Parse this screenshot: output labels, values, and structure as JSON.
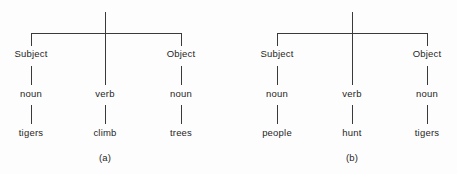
{
  "figure": {
    "background_color": "#fdfdfd",
    "line_color": "#3a3a3a",
    "text_color": "#262626",
    "trees": [
      {
        "id": "tree-a",
        "caption": "(a)",
        "root_stem": true,
        "branches": [
          {
            "position": "left",
            "level_1": "Subject",
            "level_2": "noun",
            "level_3": "tigers"
          },
          {
            "position": "center",
            "level_1": "",
            "level_2": "verb",
            "level_3": "climb"
          },
          {
            "position": "right",
            "level_1": "Object",
            "level_2": "noun",
            "level_3": "trees"
          }
        ]
      },
      {
        "id": "tree-b",
        "caption": "(b)",
        "root_stem": true,
        "branches": [
          {
            "position": "left",
            "level_1": "Subject",
            "level_2": "noun",
            "level_3": "people"
          },
          {
            "position": "center",
            "level_1": "",
            "level_2": "verb",
            "level_3": "hunt"
          },
          {
            "position": "right",
            "level_1": "Object",
            "level_2": "noun",
            "level_3": "tigers"
          }
        ]
      }
    ]
  }
}
